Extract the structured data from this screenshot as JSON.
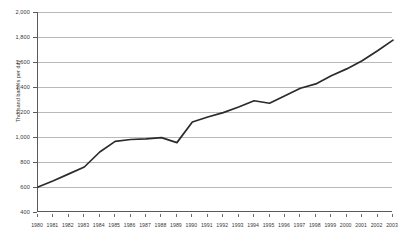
{
  "chart_data": {
    "type": "line",
    "title": "",
    "subtitle": "",
    "xlabel": "",
    "ylabel": "Thousand barrels per day",
    "ylim": [
      400,
      2000
    ],
    "ytick_step": 200,
    "ytick_labels": [
      "2,000",
      "1,800",
      "1,600",
      "1,400",
      "1,200",
      "1,000",
      "800",
      "600",
      "400"
    ],
    "ytick_values": [
      2000,
      1800,
      1600,
      1400,
      1200,
      1000,
      800,
      600,
      400
    ],
    "grid": true,
    "legend": "none",
    "line_color": "#2b2b2b",
    "categories": [
      "1980",
      "1981",
      "1982",
      "1983",
      "1984",
      "1985",
      "1986",
      "1987",
      "1988",
      "1989",
      "1990",
      "1991",
      "1992",
      "1993",
      "1994",
      "1995",
      "1996",
      "1997",
      "1998",
      "1999",
      "2000",
      "2001",
      "2002",
      "2003"
    ],
    "values": [
      600,
      650,
      705,
      760,
      880,
      965,
      980,
      985,
      995,
      955,
      1120,
      1160,
      1195,
      1240,
      1290,
      1270,
      1330,
      1390,
      1425,
      1490,
      1545,
      1610,
      1690,
      1775
    ],
    "series": [
      {
        "name": "Thousand barrels per day",
        "values": [
          600,
          650,
          705,
          760,
          880,
          965,
          980,
          985,
          995,
          955,
          1120,
          1160,
          1195,
          1240,
          1290,
          1270,
          1330,
          1390,
          1425,
          1490,
          1545,
          1610,
          1690,
          1775
        ]
      }
    ]
  }
}
